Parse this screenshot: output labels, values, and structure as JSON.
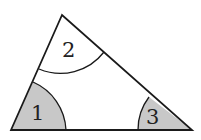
{
  "diagram": {
    "type": "triangle-angles",
    "vertices": {
      "top": [
        62,
        15
      ],
      "bottom_left": [
        11,
        130
      ],
      "bottom_right": [
        192,
        130
      ]
    },
    "angles": [
      {
        "id": "1",
        "label": "1",
        "vertex": "bottom_left",
        "shaded": true
      },
      {
        "id": "2",
        "label": "2",
        "vertex": "top",
        "shaded": false
      },
      {
        "id": "3",
        "label": "3",
        "vertex": "bottom_right",
        "shaded": true
      }
    ],
    "colors": {
      "stroke": "#1a1a1a",
      "shade": "#c8c8c8",
      "background": "#ffffff"
    }
  }
}
